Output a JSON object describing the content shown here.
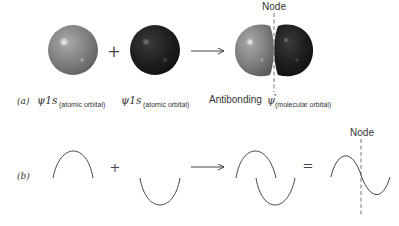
{
  "diagram": {
    "panel_a": {
      "label": "(a)",
      "operator_plus": "+",
      "orbital_1": {
        "psi": "ψ1s",
        "subscript": "(atomic orbital)",
        "phase": "positive",
        "color": "#7d7d7d"
      },
      "orbital_2": {
        "psi": "ψ1s",
        "subscript": "(atomic orbital)",
        "phase": "negative",
        "color": "#1e1e1e"
      },
      "result": {
        "prefix": "Antibonding ",
        "psi": "ψ",
        "superscript": "*",
        "subscript": "(molecular orbital)"
      },
      "node_label": "Node"
    },
    "panel_b": {
      "label": "(b)",
      "operator_plus": "+",
      "operator_equals": "=",
      "node_label": "Node"
    },
    "colors": {
      "line": "#444444",
      "text": "#333333",
      "positive_lobe": "#7d7d7d",
      "negative_lobe": "#1e1e1e"
    }
  }
}
